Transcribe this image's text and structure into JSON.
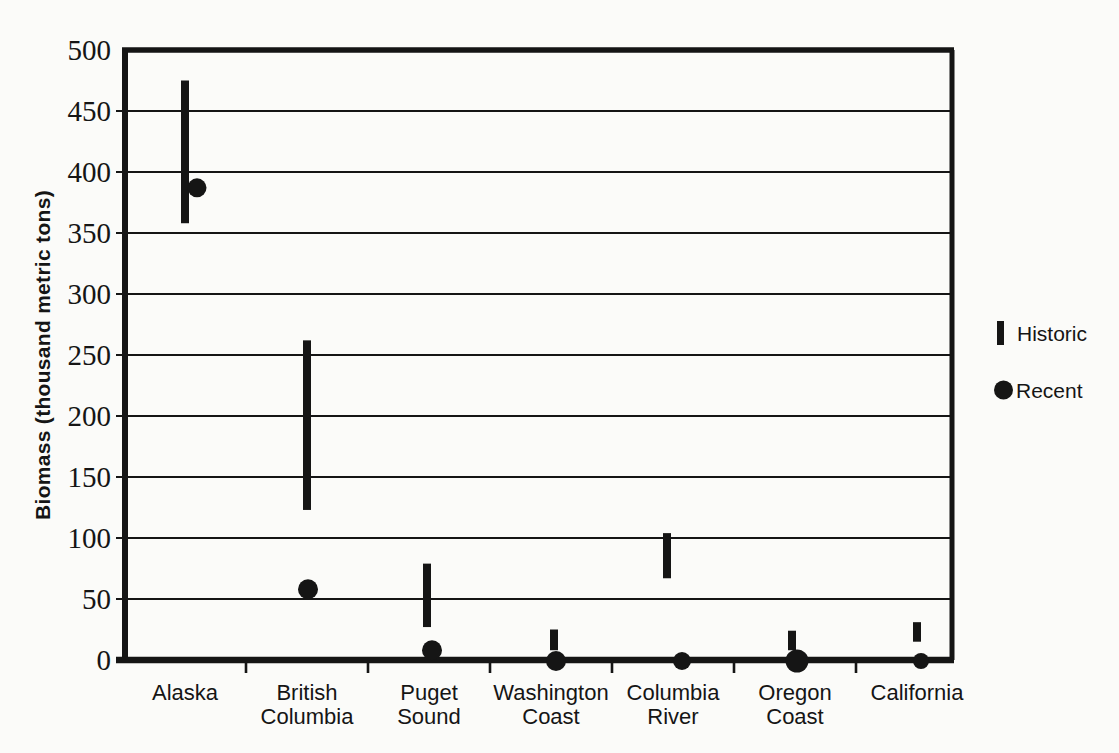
{
  "page": {
    "background_color": "#fbfbf9",
    "ink_color": "#151515"
  },
  "chart_data": {
    "type": "range-bar-scatter",
    "title": "",
    "xlabel": "",
    "ylabel": "Biomass (thousand metric tons)",
    "ylim": [
      0,
      500
    ],
    "ytick_step": 50,
    "yticks": [
      0,
      50,
      100,
      150,
      200,
      250,
      300,
      350,
      400,
      450,
      500
    ],
    "grid": "horizontal gridlines every 50, full plot width",
    "frame": "full rectangular border around plot area",
    "legend_position": "outside right, vertically near middle",
    "categories": [
      "Alaska",
      "British Columbia",
      "Puget Sound",
      "Washington Coast",
      "Columbia River",
      "Oregon Coast",
      "California"
    ],
    "category_label_lines": [
      [
        "Alaska"
      ],
      [
        "British",
        "Columbia"
      ],
      [
        "Puget",
        "Sound"
      ],
      [
        "Washington",
        "Coast"
      ],
      [
        "Columbia",
        "River"
      ],
      [
        "Oregon",
        "Coast"
      ],
      [
        "California"
      ]
    ],
    "series": [
      {
        "name": "Historic",
        "marker": "thick-vertical-bar",
        "description": "historic biomass range (low-high), thousand metric tons",
        "ranges": [
          [
            358,
            475
          ],
          [
            123,
            262
          ],
          [
            27,
            79
          ],
          [
            8,
            25
          ],
          [
            67,
            104
          ],
          [
            8,
            24
          ],
          [
            15,
            31
          ]
        ]
      },
      {
        "name": "Recent",
        "marker": "filled-dot",
        "description": "recent biomass, thousand metric tons",
        "values": [
          387,
          58,
          8,
          0,
          0,
          0,
          0
        ]
      }
    ]
  },
  "legend": {
    "items": [
      {
        "label": "Historic",
        "marker": "vertical-bar"
      },
      {
        "label": "Recent",
        "marker": "dot"
      }
    ]
  }
}
